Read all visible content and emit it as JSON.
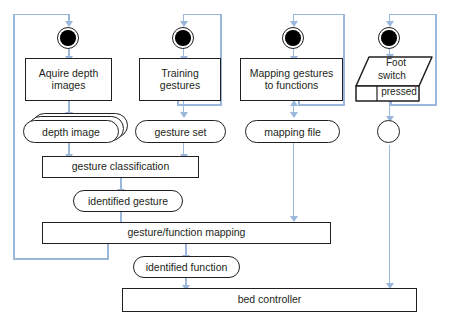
{
  "diagram": {
    "type": "uml-activity-diagram",
    "colors": {
      "stroke": "#231f20",
      "connector": "#9bb7d9",
      "background": "#ffffff",
      "start_node_fill": "#000000"
    }
  },
  "nodes": {
    "start_1": {
      "label": "",
      "kind": "initial-node"
    },
    "start_2": {
      "label": "",
      "kind": "initial-node"
    },
    "start_3": {
      "label": "",
      "kind": "initial-node"
    },
    "start_4": {
      "label": "",
      "kind": "initial-node"
    },
    "acquire_depth_images": {
      "line1": "Aquire depth",
      "line2": "images",
      "kind": "action"
    },
    "training_gestures": {
      "line1": "Training",
      "line2": "gestures",
      "kind": "action"
    },
    "mapping_gestures_to_functions": {
      "line1": "Mapping gestures",
      "line2": "to functions",
      "kind": "action"
    },
    "foot_switch_pressed": {
      "line1": "Foot",
      "line2": "switch",
      "line3": "pressed",
      "kind": "signal-receipt"
    },
    "depth_image": {
      "label": "depth image",
      "kind": "object-node-multi"
    },
    "gesture_set": {
      "label": "gesture set",
      "kind": "object-node"
    },
    "mapping_file": {
      "label": "mapping file",
      "kind": "object-node"
    },
    "foot_switch_node": {
      "label": "",
      "kind": "node-circle"
    },
    "gesture_classification": {
      "label": "gesture classification",
      "kind": "action"
    },
    "identified_gesture": {
      "label": "identified gesture",
      "kind": "object-node"
    },
    "gesture_function_mapping": {
      "label": "gesture/function mapping",
      "kind": "action"
    },
    "identified_function": {
      "label": "identified function",
      "kind": "object-node"
    },
    "bed_controller": {
      "label": "bed controller",
      "kind": "action"
    }
  }
}
